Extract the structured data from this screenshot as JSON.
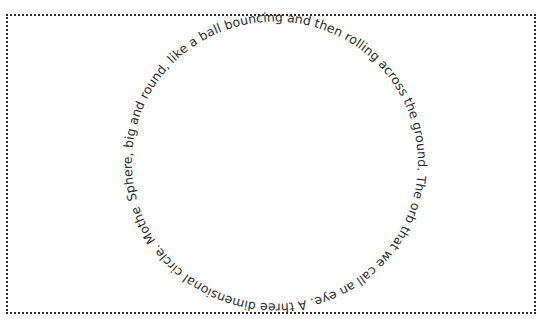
{
  "header": {
    "clipped_text": "tagline continues from the section above"
  },
  "circle_text": {
    "text": "Sphere, big and round, like a ball bouncing and then rolling across the ground. The orb that we call an eye. A three dimensional circle. Mother earth.",
    "start_offset": "0%",
    "text_color": "#2b2b2b"
  },
  "frame": {
    "border_color": "#2a2a2a",
    "style": "dotted"
  }
}
